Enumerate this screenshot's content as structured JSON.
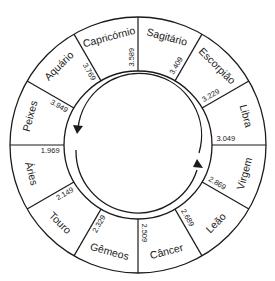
{
  "diagram": {
    "type": "zodiac-precession-wheel",
    "center": [
      138,
      145
    ],
    "outer_radius": 128,
    "inner_radius": 74,
    "arrow_radius": 62,
    "colors": {
      "line": "#1a1a1a",
      "background": "#ffffff"
    },
    "signs": [
      {
        "name": "Sagitário",
        "mid_angle": 15
      },
      {
        "name": "Escorpião",
        "mid_angle": 45
      },
      {
        "name": "Libra",
        "mid_angle": 75
      },
      {
        "name": "Virgem",
        "mid_angle": 105
      },
      {
        "name": "Leão",
        "mid_angle": 135
      },
      {
        "name": "Câncer",
        "mid_angle": 165
      },
      {
        "name": "Gêmeos",
        "mid_angle": 195
      },
      {
        "name": "Touro",
        "mid_angle": 225
      },
      {
        "name": "Áries",
        "mid_angle": 255
      },
      {
        "name": "Peixes",
        "mid_angle": 285
      },
      {
        "name": "Aquário",
        "mid_angle": 315
      },
      {
        "name": "Capricórnio",
        "mid_angle": 345
      }
    ],
    "boundaries": [
      {
        "angle": 0,
        "year": "3.589"
      },
      {
        "angle": 30,
        "year": "3.409"
      },
      {
        "angle": 60,
        "year": "3.229"
      },
      {
        "angle": 90,
        "year": "3.049"
      },
      {
        "angle": 120,
        "year": "2.869"
      },
      {
        "angle": 150,
        "year": "2.689"
      },
      {
        "angle": 180,
        "year": "2.509"
      },
      {
        "angle": 210,
        "year": "2.329"
      },
      {
        "angle": 240,
        "year": "2.149"
      },
      {
        "angle": 270,
        "year": "1.969"
      },
      {
        "angle": 300,
        "year": "3.949"
      },
      {
        "angle": 330,
        "year": "3.769"
      }
    ],
    "arrows": [
      {
        "name": "arrow-counterclockwise-left",
        "direction": "down",
        "position": "left"
      },
      {
        "name": "arrow-clockwise-right",
        "direction": "up",
        "position": "right"
      }
    ]
  }
}
